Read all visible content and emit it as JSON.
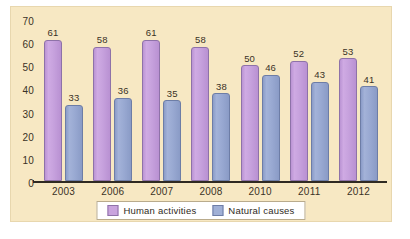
{
  "chart_data": {
    "type": "bar",
    "title": "",
    "subtitle": "",
    "xlabel": "",
    "ylabel": "",
    "categories": [
      "2003",
      "2006",
      "2007",
      "2008",
      "2010",
      "2011",
      "2012"
    ],
    "series": [
      {
        "name": "Human activities",
        "color": "#c9a4de",
        "values": [
          61,
          58,
          61,
          58,
          50,
          52,
          53
        ]
      },
      {
        "name": "Natural causes",
        "color": "#a0b0d6",
        "values": [
          33,
          36,
          35,
          38,
          46,
          43,
          41
        ]
      }
    ],
    "ylim": [
      0,
      70
    ],
    "yticks": [
      "0",
      "10",
      "20",
      "30",
      "40",
      "50",
      "60",
      "70"
    ],
    "grid": false,
    "legend_position": "bottom",
    "show_data_labels": true
  },
  "style": {
    "background": "#f7e8c3",
    "axis_color": "#2f2a22",
    "text_color": "#3a3226",
    "legend_background": "#ffffff"
  }
}
